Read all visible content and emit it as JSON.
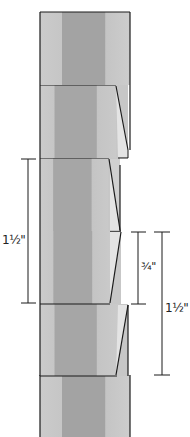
{
  "diagram": {
    "colors": {
      "light_stripe": "#c9c9c9",
      "mid_stripe": "#b4b4b4",
      "dark_stripe": "#9e9e9e",
      "fold_face": "#e2e2e2",
      "outline": "#1a1a1a"
    },
    "dimensions": [
      {
        "id": "left",
        "label": "1½\""
      },
      {
        "id": "middle",
        "label": "¾\""
      },
      {
        "id": "right",
        "label": "1½\""
      }
    ]
  }
}
